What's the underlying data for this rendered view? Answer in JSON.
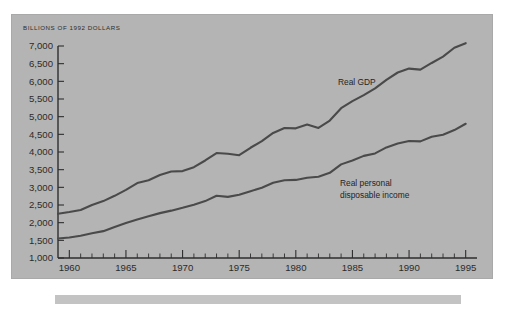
{
  "figure": {
    "background_color": "#ffffff",
    "panel_color": "#b4b4b4",
    "footer_bar_color": "#c3c3c3",
    "line_color": "#4a4a4a",
    "text_color": "#2b2b2b"
  },
  "chart_data": {
    "type": "line",
    "title": "BILLIONS OF 1992 DOLLARS",
    "xlabel": "",
    "ylabel": "",
    "xlim": [
      1959,
      1996
    ],
    "ylim": [
      1000,
      7000
    ],
    "grid": false,
    "legend_position": "inline-annotation",
    "ytick_labels": [
      "7,000",
      "6,500",
      "6,000",
      "5,500",
      "5,000",
      "4,500",
      "4,000",
      "3,500",
      "3,000",
      "2,500",
      "2,000",
      "1,500",
      "1,000"
    ],
    "ytick_values": [
      7000,
      6500,
      6000,
      5500,
      5000,
      4500,
      4000,
      3500,
      3000,
      2500,
      2000,
      1500,
      1000
    ],
    "xtick_labels": [
      "1960",
      "1965",
      "1970",
      "1975",
      "1980",
      "1985",
      "1990",
      "1995"
    ],
    "xtick_values": [
      1960,
      1965,
      1970,
      1975,
      1980,
      1985,
      1990,
      1995
    ],
    "x": [
      1959,
      1960,
      1961,
      1962,
      1963,
      1964,
      1965,
      1966,
      1967,
      1968,
      1969,
      1970,
      1971,
      1972,
      1973,
      1974,
      1975,
      1976,
      1977,
      1978,
      1979,
      1980,
      1981,
      1982,
      1983,
      1984,
      1985,
      1986,
      1987,
      1988,
      1989,
      1990,
      1991,
      1992,
      1993,
      1994,
      1995
    ],
    "series": [
      {
        "name": "Real GDP",
        "label": "Real GDP",
        "values": [
          2250,
          2300,
          2360,
          2500,
          2610,
          2760,
          2930,
          3120,
          3200,
          3350,
          3450,
          3460,
          3570,
          3760,
          3970,
          3950,
          3910,
          4120,
          4310,
          4540,
          4680,
          4670,
          4780,
          4680,
          4890,
          5240,
          5440,
          5610,
          5800,
          6040,
          6250,
          6360,
          6330,
          6520,
          6700,
          6950,
          7080
        ]
      },
      {
        "name": "Real personal disposable income",
        "label_line1": "Real personal",
        "label_line2": "disposable income",
        "values": [
          1550,
          1580,
          1630,
          1700,
          1760,
          1880,
          1990,
          2090,
          2180,
          2270,
          2340,
          2420,
          2510,
          2610,
          2760,
          2730,
          2790,
          2890,
          2990,
          3130,
          3200,
          3210,
          3270,
          3300,
          3410,
          3650,
          3760,
          3890,
          3960,
          4130,
          4240,
          4310,
          4300,
          4430,
          4490,
          4620,
          4800
        ]
      }
    ]
  },
  "annotations": {
    "gdp_label": "Real GDP",
    "rpdi_label_line1": "Real personal",
    "rpdi_label_line2": "disposable income"
  }
}
